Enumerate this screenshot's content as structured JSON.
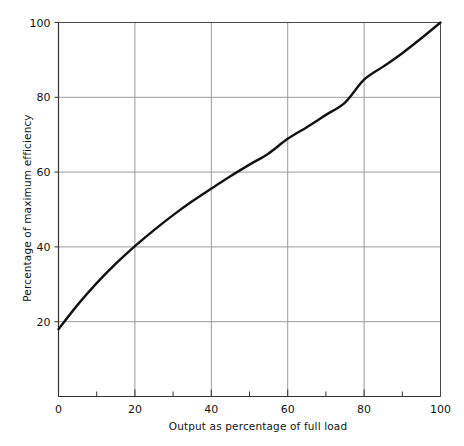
{
  "chart_data": {
    "type": "line",
    "title": "",
    "xlabel": "Output as percentage of full load",
    "ylabel": "Percentage of maximum efficiency",
    "xlim": [
      0,
      100
    ],
    "ylim": [
      0,
      100
    ],
    "xticks": [
      0,
      20,
      40,
      60,
      80,
      100
    ],
    "yticks": [
      20,
      40,
      60,
      80,
      100
    ],
    "xtick_labels": [
      "0",
      "20",
      "40",
      "60",
      "80",
      "100"
    ],
    "ytick_labels": [
      "20",
      "40",
      "60",
      "80",
      "100"
    ],
    "minor_xticks": [
      10,
      30,
      50,
      70,
      90
    ],
    "grid": true,
    "grid_color": "#9a9a9a",
    "legend": "none",
    "line_color": "#121212",
    "series": [
      {
        "name": "efficiency",
        "x": [
          0,
          5,
          10,
          15,
          20,
          25,
          30,
          35,
          40,
          45,
          50,
          55,
          60,
          65,
          70,
          75,
          80,
          85,
          90,
          95,
          100
        ],
        "y": [
          18.0,
          24.5,
          30.3,
          35.5,
          40.2,
          44.5,
          48.5,
          52.2,
          55.6,
          58.9,
          62.0,
          65.0,
          68.9,
          72.0,
          75.3,
          78.6,
          84.7,
          88.2,
          91.8,
          95.8,
          100.0
        ]
      }
    ]
  },
  "axes": {
    "y_title": "Percentage of maximum efficiency",
    "x_title": "Output as percentage of full load"
  }
}
